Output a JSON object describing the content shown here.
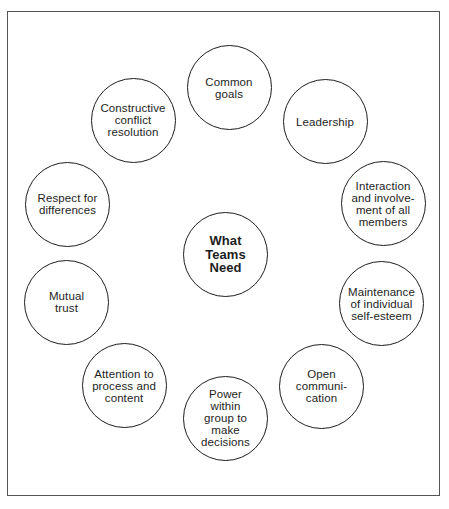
{
  "diagram": {
    "title": "What Teams Need",
    "center": {
      "label": "What\nTeams\nNeed",
      "cx": 225.5,
      "cy": 254.5
    },
    "nodes": [
      {
        "id": "common-goals",
        "label": "Common\ngoals",
        "cx": 229,
        "cy": 87.5
      },
      {
        "id": "leadership",
        "label": "Leadership",
        "cx": 325,
        "cy": 121.5
      },
      {
        "id": "interaction",
        "label": "Interaction\nand involve-\nment of all\nmembers",
        "cx": 383,
        "cy": 203.5
      },
      {
        "id": "maintenance",
        "label": "Maintenance\nof individual\nself-esteem",
        "cx": 381.5,
        "cy": 303.5
      },
      {
        "id": "open-communication",
        "label": "Open\ncommuni-\ncation",
        "cx": 321.5,
        "cy": 386
      },
      {
        "id": "power-within-group",
        "label": "Power\nwithin\ngroup to\nmake\ndecisions",
        "cx": 225.5,
        "cy": 418
      },
      {
        "id": "attention-to-process",
        "label": "Attention to\nprocess and\ncontent",
        "cx": 124,
        "cy": 385.5
      },
      {
        "id": "mutual-trust",
        "label": "Mutual\ntrust",
        "cx": 66.5,
        "cy": 302
      },
      {
        "id": "respect-for-differences",
        "label": "Respect  for\ndifferences",
        "cx": 67.5,
        "cy": 204
      },
      {
        "id": "constructive-conflict",
        "label": "Constructive\nconflict\nresolution",
        "cx": 133,
        "cy": 120
      }
    ]
  }
}
